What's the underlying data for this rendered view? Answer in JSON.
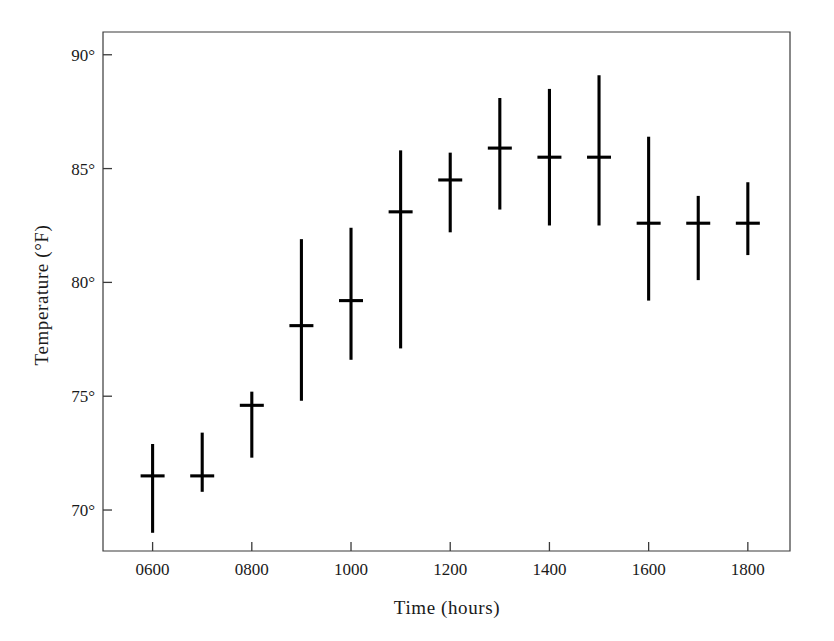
{
  "chart_data": {
    "type": "scatter",
    "title": "",
    "subtitle": "",
    "xlabel": "Time (hours)",
    "ylabel": "Temperature (°F)",
    "x": [
      600,
      700,
      800,
      900,
      1000,
      1100,
      1200,
      1300,
      1400,
      1500,
      1600,
      1700,
      1800
    ],
    "xtick_labels": [
      "0600",
      "0700",
      "0800",
      "0900",
      "1000",
      "1100",
      "1200",
      "1300",
      "1400",
      "1500",
      "1600",
      "1700",
      "1800"
    ],
    "xtick_labels_shown": [
      "0600",
      "0800",
      "1000",
      "1200",
      "1400",
      "1600",
      "1800"
    ],
    "ytick_labels": [
      "70°",
      "75°",
      "80°",
      "85°",
      "90°"
    ],
    "ytick_values": [
      70,
      75,
      80,
      85,
      90
    ],
    "xlim": [
      500,
      1885
    ],
    "ylim": [
      68.2,
      91.0
    ],
    "grid": false,
    "legend": null,
    "marker_style": "vertical-range-with-median-crossbar",
    "series": [
      {
        "name": "Median temperature",
        "values": [
          71.5,
          71.5,
          74.6,
          78.1,
          79.2,
          83.1,
          84.5,
          85.9,
          85.5,
          85.5,
          82.6,
          82.6,
          82.6
        ]
      },
      {
        "name": "Range maximum",
        "values": [
          72.9,
          73.4,
          75.2,
          81.9,
          82.4,
          85.8,
          85.7,
          88.1,
          88.5,
          89.1,
          86.4,
          83.8,
          84.4
        ]
      },
      {
        "name": "Range minimum",
        "values": [
          69.0,
          70.8,
          72.3,
          74.8,
          76.6,
          77.1,
          82.2,
          83.2,
          82.5,
          82.5,
          79.2,
          80.1,
          81.2
        ]
      }
    ]
  },
  "figure": {
    "background_color": "#ffffff",
    "line_color": "#000000",
    "frame_color": "#3a3a3a"
  }
}
